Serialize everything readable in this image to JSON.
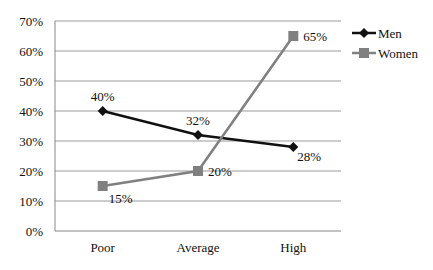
{
  "chart_data": {
    "type": "line",
    "title": "",
    "xlabel": "",
    "ylabel": "",
    "categories": [
      "Poor",
      "Average",
      "High"
    ],
    "series": [
      {
        "name": "Men",
        "values": [
          40,
          32,
          28
        ],
        "labels": [
          "40%",
          "32%",
          "28%"
        ],
        "color": "#111111",
        "marker": "diamond"
      },
      {
        "name": "Women",
        "values": [
          15,
          20,
          65
        ],
        "labels": [
          "15%",
          "20%",
          "65%"
        ],
        "color": "#808080",
        "marker": "square"
      }
    ],
    "ylim": [
      0,
      70
    ],
    "yticks": [
      "0%",
      "10%",
      "20%",
      "30%",
      "40%",
      "50%",
      "60%",
      "70%"
    ],
    "grid": true,
    "legend_position": "right"
  }
}
